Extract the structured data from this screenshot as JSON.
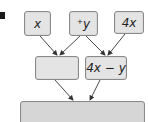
{
  "diagram": {
    "type": "expression-tree",
    "top_row": [
      {
        "id": "x",
        "label": "x"
      },
      {
        "id": "neg_y",
        "label": "⁺y"
      },
      {
        "id": "4x",
        "label": "4x"
      }
    ],
    "middle_row": [
      {
        "id": "mid_left",
        "label": ""
      },
      {
        "id": "mid_right",
        "label": "4x − y"
      }
    ],
    "bottom_row": [
      {
        "id": "result",
        "label": ""
      }
    ],
    "edges": [
      {
        "from": "x",
        "to": "mid_left"
      },
      {
        "from": "neg_y",
        "to": "mid_left"
      },
      {
        "from": "neg_y",
        "to": "mid_right"
      },
      {
        "from": "4x",
        "to": "mid_right"
      },
      {
        "from": "mid_left",
        "to": "result"
      },
      {
        "from": "mid_right",
        "to": "result"
      }
    ],
    "colors": {
      "box_fill": "#e4e4e4",
      "box_border": "#8a8a8a",
      "bottom_fill": "#d6d6d6",
      "arrow": "#333333"
    }
  }
}
